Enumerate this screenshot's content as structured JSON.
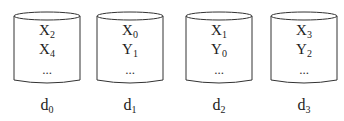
{
  "diagram": {
    "type": "disk-striping",
    "disks": [
      {
        "name": "d",
        "index": "0",
        "blocks": [
          {
            "letter": "X",
            "index": "2"
          },
          {
            "letter": "X",
            "index": "4"
          }
        ],
        "ellipsis": "..."
      },
      {
        "name": "d",
        "index": "1",
        "blocks": [
          {
            "letter": "X",
            "index": "0"
          },
          {
            "letter": "Y",
            "index": "1"
          }
        ],
        "ellipsis": "..."
      },
      {
        "name": "d",
        "index": "2",
        "blocks": [
          {
            "letter": "X",
            "index": "1"
          },
          {
            "letter": "Y",
            "index": "0"
          }
        ],
        "ellipsis": "..."
      },
      {
        "name": "d",
        "index": "3",
        "blocks": [
          {
            "letter": "X",
            "index": "3"
          },
          {
            "letter": "Y",
            "index": "2"
          }
        ],
        "ellipsis": "..."
      }
    ],
    "colors": {
      "stroke": "#333333",
      "text": "#222222",
      "background": "#ffffff"
    }
  }
}
